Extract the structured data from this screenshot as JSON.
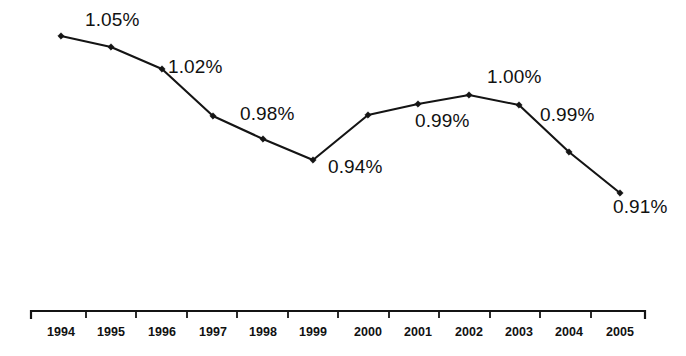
{
  "chart_data": {
    "type": "line",
    "title": "",
    "subtitle": "",
    "xlabel": "",
    "ylabel": "",
    "categories": [
      "1994",
      "1995",
      "1996",
      "1997",
      "1998",
      "1999",
      "2000",
      "2001",
      "2002",
      "2003",
      "2004",
      "2005"
    ],
    "values": [
      1.05,
      1.04,
      1.02,
      0.98,
      0.96,
      0.94,
      0.98,
      0.99,
      1.0,
      0.99,
      0.95,
      0.91
    ],
    "value_unit": "%",
    "ylim": [
      0.9,
      1.06
    ],
    "grid": false,
    "legend": false,
    "legend_position": "none",
    "marker": "diamond",
    "series": [
      {
        "name": "",
        "values": [
          1.05,
          1.04,
          1.02,
          0.98,
          0.96,
          0.94,
          0.98,
          0.99,
          1.0,
          0.99,
          0.95,
          0.91
        ]
      }
    ],
    "annotations": [
      {
        "text": "1.05%",
        "category": "1994",
        "value": 1.05,
        "x": 85,
        "y": 10
      },
      {
        "text": "1.02%",
        "category": "1996",
        "value": 1.02,
        "x": 168,
        "y": 57
      },
      {
        "text": "0.98%",
        "category": "1997",
        "value": 0.98,
        "x": 240,
        "y": 104
      },
      {
        "text": "0.94%",
        "category": "1999",
        "value": 0.94,
        "x": 328,
        "y": 157
      },
      {
        "text": "0.99%",
        "category": "2001",
        "value": 0.99,
        "x": 415,
        "y": 111
      },
      {
        "text": "1.00%",
        "category": "2002",
        "value": 1.0,
        "x": 487,
        "y": 67
      },
      {
        "text": "0.99%",
        "category": "2003",
        "value": 0.99,
        "x": 540,
        "y": 105
      },
      {
        "text": "0.91%",
        "category": "2005",
        "value": 0.91,
        "x": 613,
        "y": 197
      }
    ],
    "axis": {
      "line_color": "#141414",
      "line_y": 311,
      "x_start": 31,
      "x_end": 645,
      "tick_positions": [
        86,
        136,
        187,
        237,
        288,
        338,
        389,
        439,
        490,
        540,
        591
      ],
      "tick_label_y": 326
    },
    "series_color": "#141414",
    "point_positions": [
      {
        "category": "1994",
        "x": 61,
        "y": 36
      },
      {
        "category": "1995",
        "x": 111,
        "y": 47
      },
      {
        "category": "1996",
        "x": 162,
        "y": 69
      },
      {
        "category": "1997",
        "x": 213,
        "y": 116
      },
      {
        "category": "1998",
        "x": 263,
        "y": 139
      },
      {
        "category": "1999",
        "x": 313,
        "y": 160
      },
      {
        "category": "2000",
        "x": 368,
        "y": 115
      },
      {
        "category": "2001",
        "x": 418,
        "y": 104
      },
      {
        "category": "2002",
        "x": 469,
        "y": 95
      },
      {
        "category": "2003",
        "x": 519,
        "y": 105
      },
      {
        "category": "2004",
        "x": 569,
        "y": 152
      },
      {
        "category": "2005",
        "x": 620,
        "y": 193
      }
    ]
  }
}
